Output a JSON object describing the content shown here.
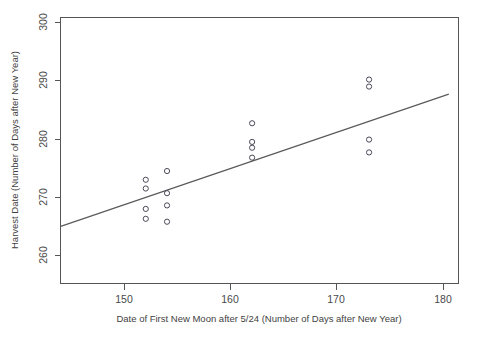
{
  "chart_data": {
    "type": "scatter",
    "title": "",
    "xlabel": "Date of First New Moon after 5/24 (Number of Days after New Year)",
    "ylabel": "Harvest Date (Number of Days after New Year)",
    "xlim": [
      144,
      180.5
    ],
    "ylim": [
      256,
      301.5
    ],
    "xticks": [
      150,
      160,
      170,
      180
    ],
    "yticks": [
      260,
      270,
      280,
      290,
      300
    ],
    "xtick_labels": [
      "150",
      "160",
      "170",
      "180"
    ],
    "ytick_labels": [
      "260",
      "270",
      "280",
      "290",
      "300"
    ],
    "grid": false,
    "legend": null,
    "marker": "open-circle",
    "marker_color": "#4a4a5a",
    "line_color": "#5a5a5a",
    "axis_color": "#555555",
    "background": "#ffffff",
    "points": [
      {
        "x": 152,
        "y": 273.0
      },
      {
        "x": 154,
        "y": 274.5
      },
      {
        "x": 154,
        "y": 270.7
      },
      {
        "x": 152,
        "y": 271.5
      },
      {
        "x": 154,
        "y": 268.6
      },
      {
        "x": 152,
        "y": 268.0
      },
      {
        "x": 152,
        "y": 266.3
      },
      {
        "x": 154,
        "y": 265.8
      },
      {
        "x": 162,
        "y": 282.7
      },
      {
        "x": 162,
        "y": 279.5
      },
      {
        "x": 162,
        "y": 278.5
      },
      {
        "x": 162,
        "y": 276.8
      },
      {
        "x": 173,
        "y": 290.2
      },
      {
        "x": 173,
        "y": 289.0
      },
      {
        "x": 173,
        "y": 279.9
      },
      {
        "x": 173,
        "y": 277.7
      }
    ],
    "trendline": {
      "type": "linear-fit",
      "x_start": 144,
      "y_start": 265.0,
      "x_end": 180.5,
      "y_end": 287.7
    }
  }
}
